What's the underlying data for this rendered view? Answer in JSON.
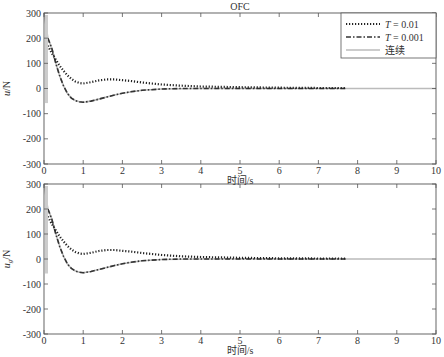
{
  "figure_title": "OFC",
  "legend": {
    "items": [
      {
        "label": "T = 0.01",
        "style": "dotted",
        "color": "#222222"
      },
      {
        "label": "T = 0.001",
        "style": "dashdot",
        "color": "#333333"
      },
      {
        "label": "连续",
        "style": "solid",
        "color": "#bbbbbb"
      }
    ]
  },
  "chart_data": [
    {
      "type": "line",
      "title": "OFC",
      "xlabel": "时间/s",
      "ylabel": "u/N",
      "xlim": [
        0,
        10
      ],
      "ylim": [
        -300,
        300
      ],
      "xticks": [
        0,
        1,
        2,
        3,
        4,
        5,
        6,
        7,
        8,
        9,
        10
      ],
      "yticks": [
        -300,
        -200,
        -100,
        0,
        100,
        200,
        300
      ],
      "grid": false,
      "legend_position": "upper right",
      "series": [
        {
          "name": "T = 0.01",
          "x": [
            0.1,
            0.2,
            0.3,
            0.4,
            0.5,
            0.6,
            0.7,
            0.8,
            0.9,
            1.0,
            1.2,
            1.4,
            1.6,
            1.8,
            2.0,
            2.2,
            2.5,
            3.0,
            3.5,
            4.0,
            5.0,
            6.0,
            7.0,
            7.7
          ],
          "y": [
            170,
            140,
            115,
            90,
            70,
            52,
            38,
            28,
            22,
            20,
            25,
            32,
            36,
            36,
            33,
            30,
            24,
            16,
            11,
            8,
            5,
            3,
            2,
            2
          ]
        },
        {
          "name": "T = 0.001",
          "x": [
            0.1,
            0.2,
            0.3,
            0.4,
            0.5,
            0.6,
            0.7,
            0.8,
            0.9,
            1.0,
            1.2,
            1.4,
            1.6,
            1.8,
            2.0,
            2.2,
            2.5,
            3.0,
            3.5,
            4.0,
            5.0,
            6.0,
            7.0,
            7.7
          ],
          "y": [
            200,
            160,
            100,
            50,
            10,
            -20,
            -38,
            -48,
            -53,
            -55,
            -50,
            -42,
            -34,
            -26,
            -19,
            -13,
            -7,
            -2,
            0,
            0,
            0,
            0,
            0,
            0
          ]
        },
        {
          "name": "连续",
          "x": [
            0,
            0.02,
            0.05,
            0.08,
            0.1,
            0.2,
            0.3,
            0.4,
            0.5,
            0.6,
            0.7,
            0.8,
            0.9,
            1.0,
            1.2,
            1.4,
            1.6,
            1.8,
            2.0,
            2.5,
            3.0,
            4.0,
            5.0,
            6.0,
            7.0,
            8.0,
            9.0,
            10.0
          ],
          "y": [
            300,
            280,
            250,
            220,
            200,
            160,
            100,
            50,
            10,
            -20,
            -38,
            -48,
            -53,
            -55,
            -50,
            -42,
            -34,
            -26,
            -19,
            -7,
            -2,
            0,
            0,
            0,
            0,
            0,
            0,
            0
          ]
        }
      ]
    },
    {
      "type": "line",
      "title": "",
      "xlabel": "时间/s",
      "ylabel": "u_g/N",
      "xlim": [
        0,
        10
      ],
      "ylim": [
        -300,
        300
      ],
      "xticks": [
        0,
        1,
        2,
        3,
        4,
        5,
        6,
        7,
        8,
        9,
        10
      ],
      "yticks": [
        -300,
        -200,
        -100,
        0,
        100,
        200,
        300
      ],
      "grid": false,
      "series": [
        {
          "name": "T = 0.01",
          "x": [
            0.1,
            0.2,
            0.3,
            0.4,
            0.5,
            0.6,
            0.7,
            0.8,
            0.9,
            1.0,
            1.2,
            1.4,
            1.6,
            1.8,
            2.0,
            2.2,
            2.5,
            3.0,
            3.5,
            4.0,
            5.0,
            6.0,
            7.0,
            7.7
          ],
          "y": [
            170,
            140,
            115,
            90,
            70,
            52,
            38,
            28,
            22,
            20,
            25,
            32,
            36,
            36,
            33,
            30,
            24,
            16,
            11,
            8,
            5,
            3,
            2,
            2
          ]
        },
        {
          "name": "T = 0.001",
          "x": [
            0.1,
            0.2,
            0.3,
            0.4,
            0.5,
            0.6,
            0.7,
            0.8,
            0.9,
            1.0,
            1.2,
            1.4,
            1.6,
            1.8,
            2.0,
            2.2,
            2.5,
            3.0,
            3.5,
            4.0,
            5.0,
            6.0,
            7.0,
            7.7
          ],
          "y": [
            200,
            160,
            100,
            50,
            10,
            -20,
            -38,
            -48,
            -53,
            -55,
            -50,
            -42,
            -34,
            -26,
            -19,
            -13,
            -7,
            -2,
            0,
            0,
            0,
            0,
            0,
            0
          ]
        },
        {
          "name": "连续",
          "x": [
            0,
            0.02,
            0.05,
            0.08,
            0.1,
            0.2,
            0.3,
            0.4,
            0.5,
            0.6,
            0.7,
            0.8,
            0.9,
            1.0,
            1.2,
            1.4,
            1.6,
            1.8,
            2.0,
            2.5,
            3.0,
            4.0,
            5.0,
            6.0,
            7.0,
            8.0,
            9.0,
            10.0
          ],
          "y": [
            300,
            280,
            250,
            220,
            200,
            160,
            100,
            50,
            10,
            -20,
            -38,
            -48,
            -53,
            -55,
            -50,
            -42,
            -34,
            -26,
            -19,
            -7,
            -2,
            0,
            0,
            0,
            0,
            0,
            0,
            0
          ]
        }
      ]
    }
  ]
}
